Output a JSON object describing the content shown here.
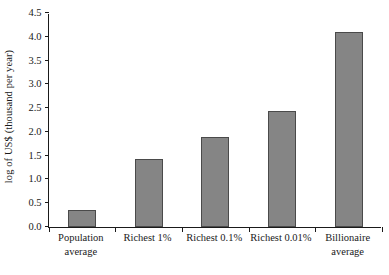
{
  "chart_data": {
    "type": "bar",
    "title": "",
    "xlabel": "",
    "ylabel": "log of US$ (thousand per year)",
    "categories": [
      "Population average",
      "Richest 1%",
      "Richest 0.1%",
      "Richest 0.01%",
      "Billionaire average"
    ],
    "category_lines": [
      [
        "Population",
        "average"
      ],
      [
        "Richest 1%",
        ""
      ],
      [
        "Richest 0.1%",
        ""
      ],
      [
        "Richest 0.01%",
        ""
      ],
      [
        "Billionaire",
        "average"
      ]
    ],
    "values": [
      0.35,
      1.42,
      1.9,
      2.45,
      4.1
    ],
    "ylim": [
      0.0,
      4.5
    ],
    "ytick_labels": [
      "0.0",
      "0.5",
      "1.0",
      "1.5",
      "2.0",
      "2.5",
      "3.0",
      "3.5",
      "4.0",
      "4.5"
    ],
    "ytick_values": [
      0.0,
      0.5,
      1.0,
      1.5,
      2.0,
      2.5,
      3.0,
      3.5,
      4.0,
      4.5
    ],
    "grid": false,
    "legend": "none",
    "bar_color": "#858585",
    "bar_edge_color": "#4a4a4a",
    "axis_color": "#1a1a1a",
    "background_color": "#ffffff"
  }
}
